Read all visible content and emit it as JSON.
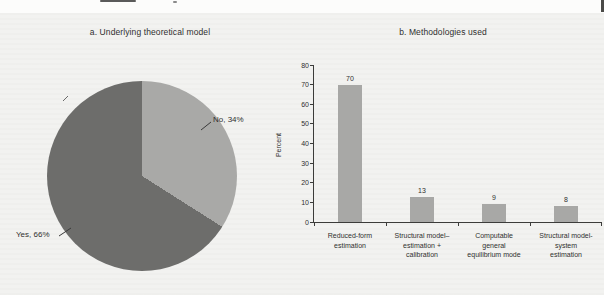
{
  "page": {
    "panel_background": "#f2f2f0",
    "top_strip_color": "#fcfcfb",
    "text_color": "#2f2f2f"
  },
  "chart_data": [
    {
      "type": "pie",
      "title": "a. Underlying theoretical model",
      "start": "top",
      "direction": "clockwise",
      "slices": [
        {
          "label": "No",
          "value": 34,
          "callout": "No, 34%",
          "color": "#a9a9a7"
        },
        {
          "label": "Yes",
          "value": 66,
          "callout": "Yes, 66%",
          "color": "#6d6d6b"
        }
      ]
    },
    {
      "type": "bar",
      "title": "b. Methodologies used",
      "ylabel": "Percent",
      "ylim": [
        0,
        80
      ],
      "ytick_step": 10,
      "grid": false,
      "bar_color": "#a8a8a6",
      "categories": [
        [
          "Reduced-form",
          "estimation"
        ],
        [
          "Structural model–",
          "estimation +",
          "calibration"
        ],
        [
          "Computable",
          "general",
          "equilibrium mode"
        ],
        [
          "Structural model-",
          "system",
          "estimation"
        ]
      ],
      "values": [
        70,
        13,
        9,
        8
      ]
    }
  ]
}
